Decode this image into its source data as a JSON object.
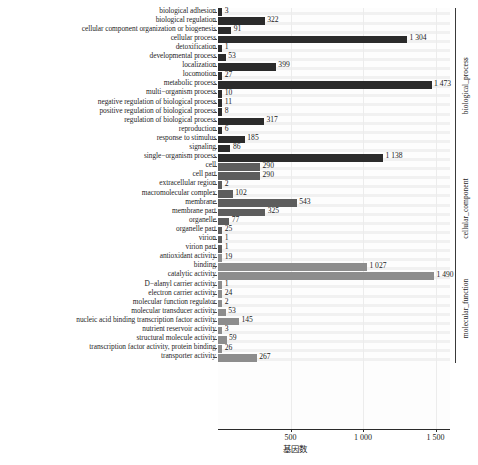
{
  "chart_data": {
    "type": "bar",
    "orientation": "horizontal",
    "title": "",
    "xlabel": "基因数",
    "ylabel": "",
    "xlim": [
      0,
      1600
    ],
    "grid": true,
    "legend_position": "right-outside",
    "xticks": [
      500,
      1000,
      1500
    ],
    "xtick_labels": [
      "500",
      "1 000",
      "1 500"
    ],
    "groups": [
      {
        "name": "biological_process",
        "color": "#2b2b2b",
        "categories": [
          "biological adhesion",
          "biological regulation",
          "cellular component organization or biogenesis",
          "cellular process",
          "detoxification",
          "developmental process",
          "localization",
          "locomotion",
          "metabolic process",
          "multi−organism process",
          "negative regulation of biological process",
          "positive regulation of biological process",
          "regulation of biological process",
          "reproduction",
          "response to stimulus",
          "signaling",
          "single−organism process"
        ],
        "values": [
          3,
          322,
          91,
          1304,
          1,
          53,
          399,
          27,
          1473,
          10,
          11,
          8,
          317,
          6,
          185,
          86,
          1138
        ],
        "value_labels": [
          "3",
          "322",
          "91",
          "1 304",
          "1",
          "53",
          "399",
          "27",
          "1 473",
          "10",
          "11",
          "8",
          "317",
          "6",
          "185",
          "86",
          "1 138"
        ]
      },
      {
        "name": "cellular_component",
        "color": "#5d5d5d",
        "categories": [
          "cell",
          "cell part",
          "extracellular region",
          "macromolecular complex",
          "membrane",
          "membrane part",
          "organelle",
          "organelle part",
          "virion",
          "virion part"
        ],
        "values": [
          290,
          290,
          2,
          102,
          543,
          325,
          77,
          25,
          1,
          1
        ],
        "value_labels": [
          "290",
          "290",
          "2",
          "102",
          "543",
          "325",
          "77",
          "25",
          "1",
          "1"
        ]
      },
      {
        "name": "molecular_function",
        "color": "#8d8d8d",
        "categories": [
          "antioxidant activity",
          "binding",
          "catalytic activity",
          "D−alanyl carrier activity",
          "electron carrier activity",
          "molecular function regulator",
          "molecular transducer activity",
          "nucleic acid binding transcription factor activity",
          "nutrient reservoir activity",
          "structural molecule activity",
          "transcription factor activity, protein binding",
          "transporter activity"
        ],
        "values": [
          19,
          1027,
          1490,
          1,
          24,
          2,
          53,
          145,
          3,
          59,
          26,
          267
        ],
        "value_labels": [
          "19",
          "1 027",
          "1 490",
          "1",
          "24",
          "2",
          "53",
          "145",
          "3",
          "59",
          "26",
          "267"
        ]
      }
    ]
  },
  "caption": {
    "text": ""
  }
}
